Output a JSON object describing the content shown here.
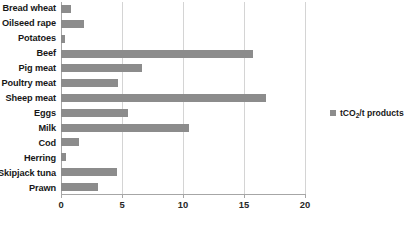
{
  "chart_data": {
    "type": "bar",
    "orientation": "horizontal",
    "title": "",
    "xlabel": "",
    "ylabel": "",
    "xlim": [
      0,
      20
    ],
    "xticks": [
      0,
      5,
      10,
      15,
      20
    ],
    "grid": true,
    "legend_position": "right",
    "series_name": "tCO2/t products",
    "bar_color": "#8c8c8c",
    "grid_color": "#d4d4d4",
    "axis_color": "#a6a6a6",
    "categories": [
      "Bread wheat",
      "Oilseed rape",
      "Potatoes",
      "Beef",
      "Pig meat",
      "Poultry meat",
      "Sheep meat",
      "Eggs",
      "Milk",
      "Cod",
      "Herring",
      "Skipjack tuna",
      "Prawn"
    ],
    "values": [
      0.85,
      1.9,
      0.3,
      15.7,
      6.6,
      4.7,
      16.8,
      5.5,
      10.5,
      1.5,
      0.4,
      4.6,
      3.0
    ]
  },
  "legend": {
    "label_main": "tCO",
    "label_sub": "2",
    "label_tail": "/t products",
    "label_full": "tCO2/t products"
  },
  "axis": {
    "tick_labels": [
      "0",
      "5",
      "10",
      "15",
      "20"
    ]
  }
}
